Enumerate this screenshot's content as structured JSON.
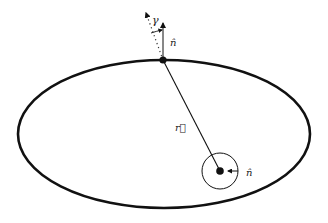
{
  "diagram": {
    "type": "orbit-ellipse",
    "colors": {
      "stroke": "#111111",
      "background": "#ffffff"
    },
    "labels": {
      "gamma": "γ",
      "normal_top": "n̂",
      "radius_vector": "r⃗",
      "normal_center": "n̂"
    },
    "elements": {
      "ellipse": {
        "cx": 164,
        "cy": 134,
        "rx": 146,
        "ry": 74
      },
      "top_point": {
        "x": 163,
        "y": 60
      },
      "center_body": {
        "x": 220,
        "y": 171,
        "circle_r": 18
      }
    }
  }
}
